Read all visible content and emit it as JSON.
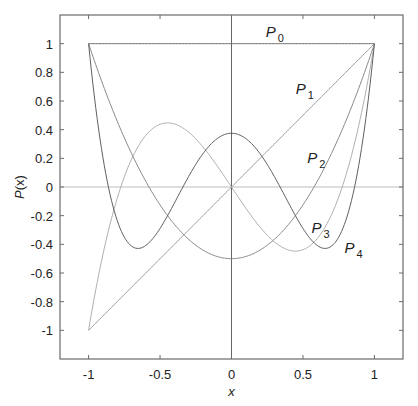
{
  "chart_data": {
    "type": "line",
    "title": "",
    "xlabel": "x",
    "ylabel": "P(x)",
    "xlim": [
      -1.2,
      1.2
    ],
    "ylim": [
      -1.2,
      1.2
    ],
    "xticks": [
      -1,
      -0.5,
      0,
      0.5,
      1
    ],
    "xtick_labels": [
      "-1",
      "-0.5",
      "0",
      "0.5",
      "1"
    ],
    "yticks": [
      1,
      0.8,
      0.6,
      0.4,
      0.2,
      0,
      -0.2,
      -0.4,
      -0.6,
      -0.8,
      -1
    ],
    "ytick_labels": [
      "1",
      "0.8",
      "0.6",
      "0.4",
      "0.2",
      "0",
      "-0.2",
      "-0.4",
      "-0.6",
      "-0.8",
      "-1"
    ],
    "grid": false,
    "legend": null,
    "reference_lines": {
      "y0": true,
      "x0": true
    },
    "series": [
      {
        "name": "P0",
        "label": "P",
        "sub": "0",
        "formula": "1",
        "color": "#6e6e6e",
        "label_pos": [
          0.24,
          1.05
        ]
      },
      {
        "name": "P1",
        "label": "P",
        "sub": "1",
        "formula": "x",
        "color": "#9a9a9a",
        "label_pos": [
          0.45,
          0.65
        ]
      },
      {
        "name": "P2",
        "label": "P",
        "sub": "2",
        "formula": "(3x^2-1)/2",
        "color": "#8a8a8a",
        "label_pos": [
          0.53,
          0.17
        ]
      },
      {
        "name": "P3",
        "label": "P",
        "sub": "3",
        "formula": "(5x^3-3x)/2",
        "color": "#b0b0b0",
        "label_pos": [
          0.56,
          -0.32
        ]
      },
      {
        "name": "P4",
        "label": "P",
        "sub": "4",
        "formula": "(35x^4-30x^2+3)/8",
        "color": "#606060",
        "label_pos": [
          0.79,
          -0.46
        ]
      }
    ],
    "x": [
      -1,
      -0.9,
      -0.8,
      -0.7,
      -0.6,
      -0.5,
      -0.4,
      -0.3,
      -0.2,
      -0.1,
      0,
      0.1,
      0.2,
      0.3,
      0.4,
      0.5,
      0.6,
      0.7,
      0.8,
      0.9,
      1
    ],
    "values": {
      "P0": [
        1,
        1,
        1,
        1,
        1,
        1,
        1,
        1,
        1,
        1,
        1,
        1,
        1,
        1,
        1,
        1,
        1,
        1,
        1,
        1,
        1
      ],
      "P1": [
        -1,
        -0.9,
        -0.8,
        -0.7,
        -0.6,
        -0.5,
        -0.4,
        -0.3,
        -0.2,
        -0.1,
        0,
        0.1,
        0.2,
        0.3,
        0.4,
        0.5,
        0.6,
        0.7,
        0.8,
        0.9,
        1
      ],
      "P2": [
        1,
        0.715,
        0.46,
        0.235,
        0.04,
        -0.125,
        -0.26,
        -0.365,
        -0.44,
        -0.485,
        -0.5,
        -0.485,
        -0.44,
        -0.365,
        -0.26,
        -0.125,
        0.04,
        0.235,
        0.46,
        0.715,
        1
      ],
      "P3": [
        -1,
        -0.4725,
        -0.08,
        0.1925,
        0.36,
        0.4375,
        0.44,
        0.3825,
        0.28,
        0.1475,
        0,
        -0.1475,
        -0.28,
        -0.3825,
        -0.44,
        -0.4375,
        -0.36,
        -0.1925,
        0.08,
        0.4725,
        1
      ],
      "P4": [
        1,
        0.2079,
        -0.233,
        -0.4121,
        -0.408,
        -0.2891,
        -0.113,
        0.0729,
        0.232,
        0.3379,
        0.375,
        0.3379,
        0.232,
        0.0729,
        -0.113,
        -0.2891,
        -0.408,
        -0.4121,
        -0.233,
        0.2079,
        1
      ]
    }
  },
  "plot_area": {
    "left": 60,
    "top": 15,
    "right": 403,
    "bottom": 359
  },
  "colors": {
    "axes": "#6a6a6a",
    "zero_line": "#bdbdbd",
    "x0_line": "#555555",
    "text": "#222222"
  }
}
